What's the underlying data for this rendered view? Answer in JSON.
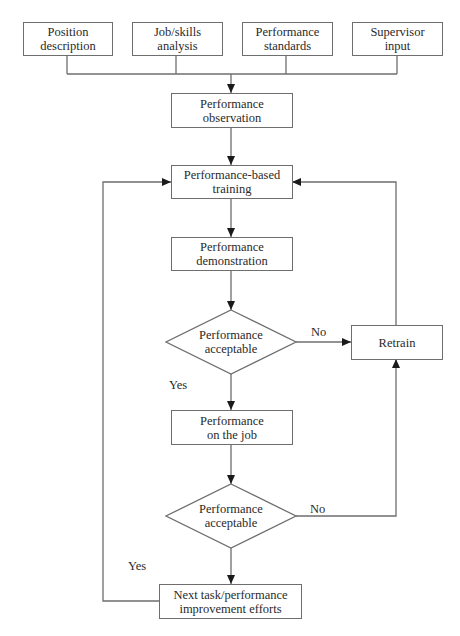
{
  "diagram": {
    "type": "flowchart",
    "inputs": [
      {
        "id": "position",
        "label": "Position\ndescription"
      },
      {
        "id": "jobskills",
        "label": "Job/skills\nanalysis"
      },
      {
        "id": "standards",
        "label": "Performance\nstandards"
      },
      {
        "id": "supervisor",
        "label": "Supervisor\ninput"
      }
    ],
    "nodes": {
      "observation": "Performance\nobservation",
      "training": "Performance-based\ntraining",
      "demonstration": "Performance\ndemonstration",
      "decision1": "Performance\nacceptable",
      "retrain": "Retrain",
      "onthejob": "Performance\non the job",
      "decision2": "Performance\nacceptable",
      "next": "Next task/performance\nimprovement efforts"
    },
    "edge_labels": {
      "d1_no": "No",
      "d1_yes": "Yes",
      "d2_no": "No",
      "d2_yes": "Yes"
    },
    "colors": {
      "line": "#6e6e6e",
      "arrowhead": "#1a1a1a",
      "text": "#2a2a2a",
      "background": "#ffffff"
    }
  }
}
